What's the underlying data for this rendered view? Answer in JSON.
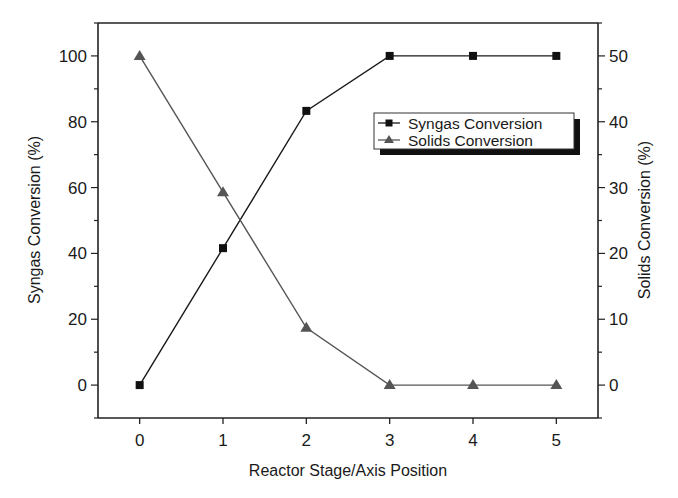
{
  "chart_data": {
    "type": "line",
    "title": "",
    "xlabel": "Reactor Stage/Axis Position",
    "ylabel": "Syngas Conversion (%)",
    "y2label": "Solids Conversion (%)",
    "x": [
      0,
      1,
      2,
      3,
      4,
      5
    ],
    "xlim": [
      -0.5,
      5.5
    ],
    "ylim": [
      -10,
      110
    ],
    "y2lim": [
      -5,
      55
    ],
    "xticks": [
      "0",
      "1",
      "2",
      "3",
      "4",
      "5"
    ],
    "yticks": [
      "0",
      "20",
      "40",
      "60",
      "80",
      "100"
    ],
    "y2ticks": [
      "0",
      "10",
      "20",
      "30",
      "40",
      "50"
    ],
    "grid": false,
    "legend_position": "upper right (inside)",
    "series": [
      {
        "name": "Syngas Conversion",
        "axis": "left",
        "marker": "square",
        "color": "#1a1a1a",
        "values": [
          0,
          41.6,
          83.3,
          100,
          100,
          100
        ]
      },
      {
        "name": "Solids Conversion",
        "axis": "right",
        "marker": "triangle",
        "color": "#555555",
        "values": [
          50,
          29.3,
          8.7,
          0,
          0,
          0
        ]
      }
    ]
  },
  "legend": {
    "items": [
      {
        "label": "Syngas Conversion"
      },
      {
        "label": "Solids Conversion"
      }
    ]
  },
  "axes": {
    "x_title": "Reactor Stage/Axis Position",
    "y_left_title": "Syngas Conversion (%)",
    "y_right_title": "Solids Conversion (%)"
  }
}
